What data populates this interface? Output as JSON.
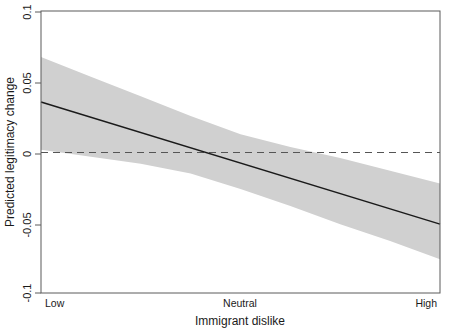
{
  "chart_data": {
    "type": "line",
    "title": "",
    "subtitle": "",
    "xlabel": "Immigrant dislike",
    "ylabel": "Predicted legitimacy change",
    "xlim": [
      0,
      1
    ],
    "ylim": [
      -0.1,
      0.1
    ],
    "grid": false,
    "legend": "none",
    "x_tick_labels": [
      "Low",
      "Neutral",
      "High"
    ],
    "x_tick_values": [
      0,
      0.5,
      1
    ],
    "y_tick_labels": [
      "0.1",
      "0.05",
      "0",
      "-0.05",
      "-0.1"
    ],
    "y_tick_values": [
      0.1,
      0.05,
      0,
      -0.05,
      -0.1
    ],
    "series": [
      {
        "name": "Predicted legitimacy change",
        "kind": "line",
        "x": [
          0,
          0.125,
          0.25,
          0.375,
          0.5,
          0.625,
          0.75,
          0.875,
          1
        ],
        "values": [
          0.036,
          0.025,
          0.014,
          0.003,
          -0.008,
          -0.019,
          -0.03,
          -0.041,
          -0.051
        ]
      },
      {
        "name": "95% confidence interval upper",
        "kind": "band-upper",
        "x": [
          0,
          0.125,
          0.25,
          0.375,
          0.5,
          0.625,
          0.75,
          0.875,
          1
        ],
        "values": [
          0.068,
          0.054,
          0.04,
          0.026,
          0.013,
          0.004,
          -0.004,
          -0.013,
          -0.022
        ]
      },
      {
        "name": "95% confidence interval lower",
        "kind": "band-lower",
        "x": [
          0,
          0.125,
          0.25,
          0.375,
          0.5,
          0.625,
          0.75,
          0.875,
          1
        ],
        "values": [
          0.002,
          -0.003,
          -0.008,
          -0.015,
          -0.026,
          -0.038,
          -0.051,
          -0.063,
          -0.076
        ]
      }
    ],
    "reference_lines": [
      {
        "name": "zero-line",
        "orientation": "horizontal",
        "value": 0,
        "style": "dashed"
      }
    ],
    "colors": {
      "line": "#1a1a1a",
      "band": "#d0d0d0",
      "axis": "#4d4d4d",
      "reference": "#666666",
      "background": "#ffffff"
    }
  },
  "axes": {
    "y_title": "Predicted legitimacy change",
    "x_title": "Immigrant dislike",
    "y_ticks": [
      "0.1",
      "0.05",
      "0",
      "-0.05",
      "-0.1"
    ],
    "x_ticks": [
      "Low",
      "Neutral",
      "High"
    ]
  }
}
